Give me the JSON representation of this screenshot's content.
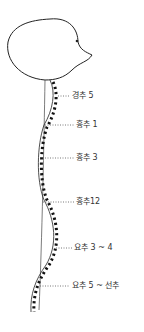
{
  "diagram": {
    "title": "",
    "labels": [
      {
        "id": "c5",
        "text": "경추 5",
        "x": 72,
        "y": 92,
        "leader_from_x": 58
      },
      {
        "id": "t1",
        "text": "흉추 1",
        "x": 76,
        "y": 121,
        "leader_from_x": 45
      },
      {
        "id": "t3",
        "text": "흉추 3",
        "x": 76,
        "y": 154,
        "leader_from_x": 42
      },
      {
        "id": "t12",
        "text": "흉추12",
        "x": 76,
        "y": 199,
        "leader_from_x": 43
      },
      {
        "id": "l34",
        "text": "요추 3 ~ 4",
        "x": 74,
        "y": 245,
        "leader_from_x": 55
      },
      {
        "id": "l5s",
        "text": "요추 5 ~ 선추",
        "x": 72,
        "y": 283,
        "leader_from_x": 40
      }
    ]
  }
}
